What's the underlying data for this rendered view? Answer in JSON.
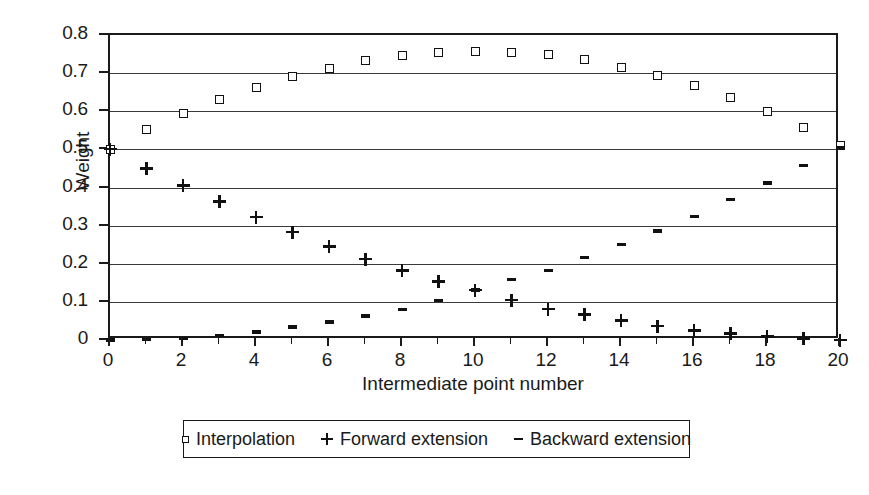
{
  "chart_data": {
    "type": "scatter",
    "title": "",
    "xlabel": "Intermediate point number",
    "ylabel": "Weight",
    "xlim": [
      0,
      20
    ],
    "ylim": [
      0,
      0.8
    ],
    "xticks": [
      0,
      2,
      4,
      6,
      8,
      10,
      12,
      14,
      16,
      18,
      20
    ],
    "xtick_labels": [
      "0",
      "2",
      "4",
      "6",
      "8",
      "10",
      "12",
      "14",
      "16",
      "18",
      "20"
    ],
    "yticks": [
      0,
      0.1,
      0.2,
      0.3,
      0.4,
      0.5,
      0.6,
      0.7,
      0.8
    ],
    "ytick_labels": [
      "0",
      "0.1",
      "0.2",
      "0.3",
      "0.4",
      "0.5",
      "0.6",
      "0.7",
      "0.8"
    ],
    "grid": "horizontal",
    "legend_position": "below-plot",
    "x": [
      0,
      1,
      2,
      3,
      4,
      5,
      6,
      7,
      8,
      9,
      10,
      11,
      12,
      13,
      14,
      15,
      16,
      17,
      18,
      19,
      20
    ],
    "series": [
      {
        "name": "Interpolation",
        "marker": "square",
        "values": [
          0.5,
          0.553,
          0.594,
          0.632,
          0.661,
          0.69,
          0.713,
          0.734,
          0.745,
          0.754,
          0.756,
          0.754,
          0.748,
          0.736,
          0.716,
          0.694,
          0.667,
          0.636,
          0.599,
          0.557,
          0.51
        ]
      },
      {
        "name": "Forward extension",
        "marker": "plus",
        "values": [
          0.5,
          0.45,
          0.405,
          0.363,
          0.322,
          0.283,
          0.245,
          0.212,
          0.182,
          0.153,
          0.131,
          0.104,
          0.081,
          0.066,
          0.05,
          0.036,
          0.024,
          0.017,
          0.008,
          0.003,
          0.0
        ]
      },
      {
        "name": "Backward extension",
        "marker": "dash",
        "values": [
          0.0,
          0.002,
          0.005,
          0.012,
          0.021,
          0.034,
          0.047,
          0.063,
          0.081,
          0.103,
          0.131,
          0.159,
          0.183,
          0.217,
          0.25,
          0.286,
          0.325,
          0.369,
          0.412,
          0.457,
          0.505
        ]
      }
    ],
    "legend": [
      {
        "label": "Interpolation",
        "marker": "square"
      },
      {
        "label": "Forward extension",
        "marker": "plus"
      },
      {
        "label": "Backward extension",
        "marker": "dash"
      }
    ]
  }
}
